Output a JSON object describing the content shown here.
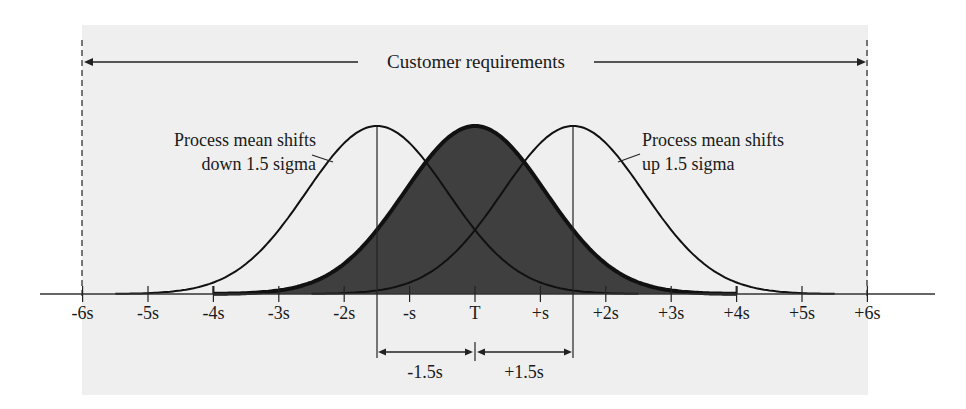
{
  "chart_data": {
    "type": "area",
    "title": "Customer requirements",
    "xlabel": "",
    "ylabel": "",
    "x_ticks": [
      "-6s",
      "-5s",
      "-4s",
      "-3s",
      "-2s",
      "-s",
      "T",
      "+s",
      "+2s",
      "+3s",
      "+4s",
      "+5s",
      "+6s"
    ],
    "x_tick_values": [
      -6,
      -5,
      -4,
      -3,
      -2,
      -1,
      0,
      1,
      2,
      3,
      4,
      5,
      6
    ],
    "xlim": [
      -6,
      6
    ],
    "spec_limits": {
      "lower": -6,
      "upper": 6,
      "label": "Customer requirements"
    },
    "series": [
      {
        "name": "Centered process",
        "mean": 0,
        "range": [
          -4,
          4
        ],
        "filled": true,
        "fill_color": "#3f3f3f"
      },
      {
        "name": "Process mean shifts down 1.5 sigma",
        "mean": -1.5,
        "range": [
          -5.5,
          2.5
        ],
        "filled": false
      },
      {
        "name": "Process mean shifts up 1.5 sigma",
        "mean": 1.5,
        "range": [
          -2.5,
          5.5
        ],
        "filled": false
      }
    ],
    "annotations": [
      {
        "text": "Process mean shifts down 1.5 sigma",
        "line1": "Process mean shifts",
        "line2": "down 1.5 sigma",
        "target_mean": -1.5
      },
      {
        "text": "Process mean shifts up 1.5 sigma",
        "line1": "Process mean shifts",
        "line2": "up 1.5 sigma",
        "target_mean": 1.5
      },
      {
        "text": "-1.5s",
        "from": -1.5,
        "to": 0
      },
      {
        "text": "+1.5s",
        "from": 0,
        "to": 1.5
      }
    ],
    "grid": false,
    "legend": "none"
  },
  "labels": {
    "customer_requirements": "Customer requirements",
    "down_line1": "Process mean shifts",
    "down_line2": "down 1.5 sigma",
    "up_line1": "Process mean shifts",
    "up_line2": "up 1.5 sigma",
    "minus_shift": "-1.5s",
    "plus_shift": "+1.5s"
  },
  "colors": {
    "panel": "#efefef",
    "fill": "#3f3f3f",
    "line": "#111111"
  }
}
